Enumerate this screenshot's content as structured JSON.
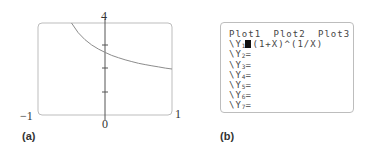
{
  "panel_a": {
    "caption": "(a)",
    "labels": {
      "y_max": "4",
      "x_min": "−1",
      "x_max": "1",
      "origin": "0"
    }
  },
  "panel_b": {
    "caption": "(b)",
    "header": [
      "Plot1",
      "Plot2",
      "Plot3"
    ],
    "equations": [
      {
        "prefix": "\\Y",
        "index": "1",
        "expr": "(1+X)^(1/X)",
        "selected": true
      },
      {
        "prefix": "\\Y",
        "index": "2",
        "expr": "",
        "selected": false
      },
      {
        "prefix": "\\Y",
        "index": "3",
        "expr": "",
        "selected": false
      },
      {
        "prefix": "\\Y",
        "index": "4",
        "expr": "",
        "selected": false
      },
      {
        "prefix": "\\Y",
        "index": "5",
        "expr": "",
        "selected": false
      },
      {
        "prefix": "\\Y",
        "index": "6",
        "expr": "",
        "selected": false
      },
      {
        "prefix": "\\Y",
        "index": "7",
        "expr": "",
        "selected": false
      }
    ],
    "equals": "="
  },
  "chart_data": {
    "type": "line",
    "title": "",
    "function": "y = (1+x)^(1/x)",
    "xlabel": "",
    "ylabel": "",
    "xlim": [
      -1,
      1
    ],
    "ylim": [
      0,
      4
    ],
    "y_ticks": [
      1,
      2,
      3
    ],
    "grid": false,
    "x": [
      -0.5,
      -0.4,
      -0.3,
      -0.2,
      -0.1,
      0.001,
      0.1,
      0.2,
      0.3,
      0.4,
      0.5,
      0.6,
      0.7,
      0.8,
      0.9,
      1.0
    ],
    "y": [
      4.0,
      3.58,
      3.28,
      3.05,
      2.87,
      2.72,
      2.59,
      2.49,
      2.4,
      2.32,
      2.25,
      2.19,
      2.14,
      2.09,
      2.04,
      2.0
    ],
    "colors": {
      "curve": "#8c8c8c",
      "axis": "#555555",
      "frame": "#bdbdbd"
    }
  }
}
